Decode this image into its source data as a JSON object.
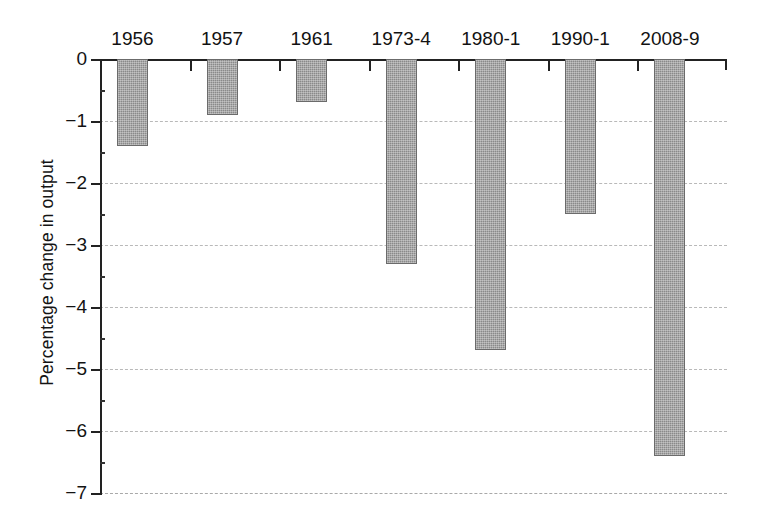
{
  "chart_data": {
    "type": "bar",
    "title": "",
    "xlabel": "",
    "ylabel": "Percentage change in output",
    "categories": [
      "1956",
      "1957",
      "1961",
      "1973-4",
      "1980-1",
      "1990-1",
      "2008-9"
    ],
    "values": [
      -1.4,
      -0.9,
      -0.7,
      -3.3,
      -4.7,
      -2.5,
      -6.4
    ],
    "ylim": [
      -7,
      0
    ],
    "ytick_labels": [
      "0",
      "−1",
      "−2",
      "−3",
      "−4",
      "−5",
      "−6",
      "−7"
    ],
    "ytick_values": [
      0,
      -1,
      -2,
      -3,
      -4,
      -5,
      -6,
      -7
    ],
    "grid": true,
    "grid_axis": "y",
    "grid_style": "dashed",
    "legend": "none",
    "xtick_label_position": "top",
    "bar_color": "#8a8a8a",
    "bar_edge_color": "#6b6b6b",
    "axis_color": "#222222",
    "gridline_color": "#b9b9b9",
    "background_color": "#ffffff",
    "orientation": "vertical",
    "bars_direction": "downward"
  }
}
